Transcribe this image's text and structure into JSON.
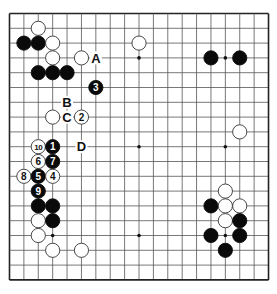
{
  "board": {
    "size": 19,
    "origin_x": 9.5,
    "origin_y": 13.5,
    "step_x": 14.39,
    "step_y": 14.8,
    "stone_radius": 7.1,
    "colors": {
      "background": "#ffffff",
      "line": "#555555",
      "border": "#222222",
      "black_stone": "#0a0a0a",
      "white_stone": "#ffffff",
      "white_stone_stroke": "#333333",
      "label_text": "#111111"
    },
    "star_points": [
      [
        3,
        3
      ],
      [
        9,
        3
      ],
      [
        15,
        3
      ],
      [
        3,
        9
      ],
      [
        9,
        9
      ],
      [
        15,
        9
      ],
      [
        3,
        15
      ],
      [
        9,
        15
      ],
      [
        15,
        15
      ]
    ]
  },
  "stones": [
    {
      "color": "white",
      "col": 2,
      "row": 1,
      "label": ""
    },
    {
      "color": "black",
      "col": 1,
      "row": 2,
      "label": ""
    },
    {
      "color": "black",
      "col": 2,
      "row": 2,
      "label": ""
    },
    {
      "color": "white",
      "col": 3,
      "row": 2,
      "label": ""
    },
    {
      "color": "white",
      "col": 3,
      "row": 3,
      "label": ""
    },
    {
      "color": "white",
      "col": 5,
      "row": 3,
      "label": ""
    },
    {
      "color": "black",
      "col": 2,
      "row": 4,
      "label": ""
    },
    {
      "color": "black",
      "col": 3,
      "row": 4,
      "label": ""
    },
    {
      "color": "black",
      "col": 4,
      "row": 4,
      "label": ""
    },
    {
      "color": "black",
      "col": 6,
      "row": 5,
      "label": "3"
    },
    {
      "color": "white",
      "col": 3,
      "row": 7,
      "label": ""
    },
    {
      "color": "white",
      "col": 5,
      "row": 7,
      "label": "2"
    },
    {
      "color": "white",
      "col": 2,
      "row": 9,
      "label": "10"
    },
    {
      "color": "black",
      "col": 3,
      "row": 9,
      "label": "1"
    },
    {
      "color": "white",
      "col": 2,
      "row": 10,
      "label": "6"
    },
    {
      "color": "black",
      "col": 3,
      "row": 10,
      "label": "7"
    },
    {
      "color": "white",
      "col": 1,
      "row": 11,
      "label": "8"
    },
    {
      "color": "black",
      "col": 2,
      "row": 11,
      "label": "5"
    },
    {
      "color": "white",
      "col": 3,
      "row": 11,
      "label": "4"
    },
    {
      "color": "black",
      "col": 2,
      "row": 12,
      "label": "9"
    },
    {
      "color": "black",
      "col": 2,
      "row": 13,
      "label": ""
    },
    {
      "color": "black",
      "col": 3,
      "row": 13,
      "label": ""
    },
    {
      "color": "white",
      "col": 2,
      "row": 14,
      "label": ""
    },
    {
      "color": "black",
      "col": 3,
      "row": 14,
      "label": ""
    },
    {
      "color": "white",
      "col": 2,
      "row": 15,
      "label": ""
    },
    {
      "color": "white",
      "col": 3,
      "row": 16,
      "label": ""
    },
    {
      "color": "white",
      "col": 5,
      "row": 16,
      "label": ""
    },
    {
      "color": "white",
      "col": 9,
      "row": 2,
      "label": ""
    },
    {
      "color": "black",
      "col": 14,
      "row": 3,
      "label": ""
    },
    {
      "color": "black",
      "col": 16,
      "row": 3,
      "label": ""
    },
    {
      "color": "white",
      "col": 16,
      "row": 8,
      "label": ""
    },
    {
      "color": "white",
      "col": 15,
      "row": 12,
      "label": ""
    },
    {
      "color": "black",
      "col": 14,
      "row": 13,
      "label": ""
    },
    {
      "color": "white",
      "col": 15,
      "row": 13,
      "label": ""
    },
    {
      "color": "white",
      "col": 16,
      "row": 13,
      "label": ""
    },
    {
      "color": "white",
      "col": 15,
      "row": 14,
      "label": ""
    },
    {
      "color": "black",
      "col": 16,
      "row": 14,
      "label": ""
    },
    {
      "color": "black",
      "col": 14,
      "row": 15,
      "label": ""
    },
    {
      "color": "black",
      "col": 16,
      "row": 15,
      "label": ""
    },
    {
      "color": "black",
      "col": 15,
      "row": 16,
      "label": ""
    }
  ],
  "markers": [
    {
      "label": "A",
      "col": 6,
      "row": 3
    },
    {
      "label": "B",
      "col": 4,
      "row": 6
    },
    {
      "label": "C",
      "col": 4,
      "row": 7
    },
    {
      "label": "D",
      "col": 5,
      "row": 9
    }
  ]
}
